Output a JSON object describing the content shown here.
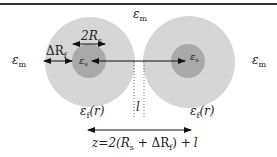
{
  "diagram": {
    "colors": {
      "top_rule": "#333333",
      "shell": "#d6d6d6",
      "core": "#a9a9a9",
      "line": "#111111",
      "background": "#ffffff"
    },
    "labels": {
      "medium_top": {
        "main": "ε",
        "sub": "m"
      },
      "medium_left": {
        "main": "ε",
        "sub": "m"
      },
      "medium_right": {
        "main": "ε",
        "sub": "m"
      },
      "core_left": {
        "main": "ε",
        "sub": "s"
      },
      "core_right": {
        "main": "ε",
        "sub": "s"
      },
      "shell_left": {
        "main": "ε",
        "sub": "f",
        "suffix": "(r)"
      },
      "shell_right": {
        "main": "ε",
        "sub": "f",
        "suffix": "(r)"
      },
      "core_diameter": {
        "prefix": "2R",
        "sub": "s"
      },
      "shell_thickness": {
        "prefix": "ΔR",
        "sub": "f"
      },
      "gap": "l",
      "separation": {
        "part1": "z=2(R",
        "sub1": "s",
        "part2": " + ΔR",
        "sub2": "f",
        "part3": ") +",
        "tail": "l"
      }
    },
    "nodes": [
      {
        "id": "left-sphere",
        "shell_label": "ε_f(r)",
        "core_label": "ε_s"
      },
      {
        "id": "right-sphere",
        "shell_label": "ε_f(r)",
        "core_label": "ε_s"
      }
    ],
    "edges": [
      {
        "from": "left-sphere-center",
        "to": "right-sphere-center",
        "type": "arrow"
      },
      {
        "label": "z=2(R_s + ΔR_f) + l",
        "type": "double-arrow"
      }
    ]
  }
}
